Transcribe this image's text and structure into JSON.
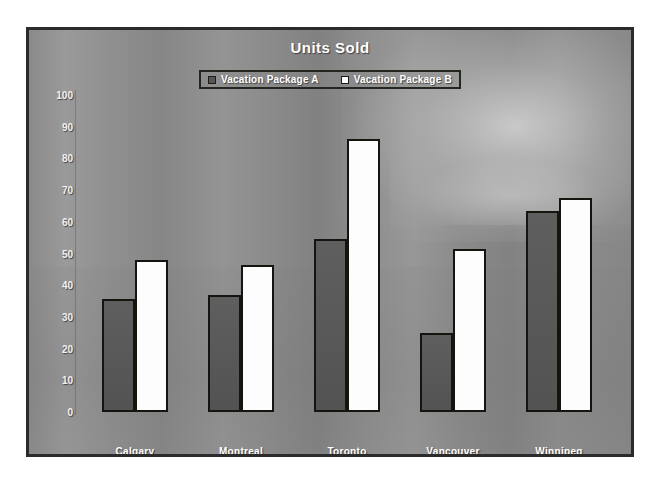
{
  "chart_data": {
    "type": "bar",
    "title": "Units Sold",
    "xlabel": "",
    "ylabel": "",
    "ylim": [
      0,
      100
    ],
    "yticks": [
      0,
      10,
      20,
      30,
      40,
      50,
      60,
      70,
      80,
      90,
      100
    ],
    "grid": false,
    "legend_position": "top-center",
    "categories": [
      "Calgary",
      "Montreal",
      "Toronto",
      "Vancouver",
      "Winnipeg"
    ],
    "series": [
      {
        "name": "Vacation Package A",
        "color": "#565656",
        "values": [
          35.5,
          37,
          54.5,
          25,
          63.5
        ]
      },
      {
        "name": "Vacation Package B",
        "color": "#ffffff",
        "values": [
          48,
          46.5,
          86,
          51.5,
          67.5
        ]
      }
    ]
  },
  "colors": {
    "series_a": "#565656",
    "series_b": "#ffffff",
    "bar_outline": "#15150f",
    "frame_border": "#2b2b2b",
    "background": "#8d8d8d",
    "text": "#ffffff"
  }
}
